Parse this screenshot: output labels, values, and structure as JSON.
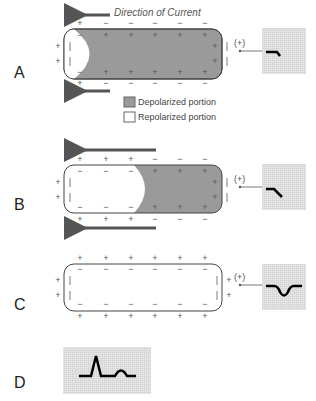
{
  "title": "Direction of Current",
  "panels": [
    {
      "label": "A",
      "electrode": "(+)",
      "state": "depolarizing-start",
      "depolarized_from_x": 95
    },
    {
      "label": "B",
      "electrode": "(+)",
      "state": "repolarizing-half",
      "depolarized_from_x": 140
    },
    {
      "label": "C",
      "electrode": "(+)",
      "state": "fully-repolarized"
    },
    {
      "label": "D",
      "state": "ecg-complex"
    }
  ],
  "legend": {
    "depolarized": "Depolarized portion",
    "repolarized": "Repolarized portion",
    "depolarized_color": "#9a9a9a",
    "repolarized_color": "#ffffff"
  }
}
